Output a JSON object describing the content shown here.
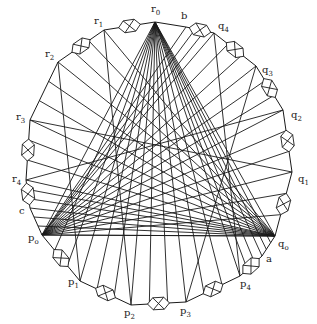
{
  "figure": {
    "ink_color": "#1a1a1a",
    "background": "#ffffff"
  },
  "labels": [
    {
      "id": "r0",
      "base": "r",
      "sub": "0"
    },
    {
      "id": "b",
      "base": "b",
      "sub": ""
    },
    {
      "id": "q4",
      "base": "q",
      "sub": "4"
    },
    {
      "id": "q3",
      "base": "q",
      "sub": "3"
    },
    {
      "id": "q2",
      "base": "q",
      "sub": "2"
    },
    {
      "id": "q1",
      "base": "q",
      "sub": "1"
    },
    {
      "id": "q0",
      "base": "q",
      "sub": "o"
    },
    {
      "id": "a",
      "base": "a",
      "sub": ""
    },
    {
      "id": "p4",
      "base": "p",
      "sub": "4"
    },
    {
      "id": "p3",
      "base": "p",
      "sub": "3"
    },
    {
      "id": "p2",
      "base": "p",
      "sub": "2"
    },
    {
      "id": "p1",
      "base": "p",
      "sub": "1"
    },
    {
      "id": "p0",
      "base": "p",
      "sub": "o"
    },
    {
      "id": "c",
      "base": "c",
      "sub": ""
    },
    {
      "id": "r4",
      "base": "r",
      "sub": "4"
    },
    {
      "id": "r3",
      "base": "r",
      "sub": "3"
    },
    {
      "id": "r2",
      "base": "r",
      "sub": "2"
    },
    {
      "id": "r1",
      "base": "r",
      "sub": "1"
    }
  ],
  "apexes": [
    "r0",
    "p0",
    "q0"
  ]
}
